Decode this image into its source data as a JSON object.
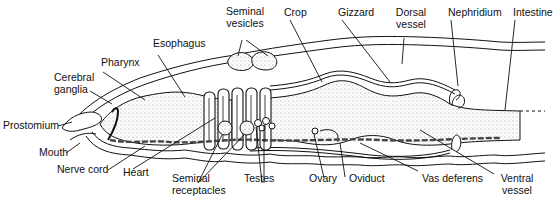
{
  "diagram": {
    "colors": {
      "ink": "#111111",
      "stipple": "#d9d9d9",
      "background": "#ffffff"
    },
    "labels": {
      "prostomium": "Prostomium",
      "mouth": "Mouth",
      "cerebral_ganglia_1": "Cerebral",
      "cerebral_ganglia_2": "ganglia",
      "pharynx": "Pharynx",
      "esophagus": "Esophagus",
      "seminal_vesicles_1": "Seminal",
      "seminal_vesicles_2": "vesicles",
      "crop": "Crop",
      "gizzard": "Gizzard",
      "dorsal_vessel_1": "Dorsal",
      "dorsal_vessel_2": "vessel",
      "nephridium": "Nephridium",
      "intestine": "Intestine",
      "nerve_cord": "Nerve cord",
      "heart": "Heart",
      "seminal_receptacles_1": "Seminal",
      "seminal_receptacles_2": "receptacles",
      "testes": "Testes",
      "ovary": "Ovary",
      "oviduct": "Oviduct",
      "vas_deferens": "Vas deferens",
      "ventral_vessel_1": "Ventral",
      "ventral_vessel_2": "vessel"
    }
  }
}
